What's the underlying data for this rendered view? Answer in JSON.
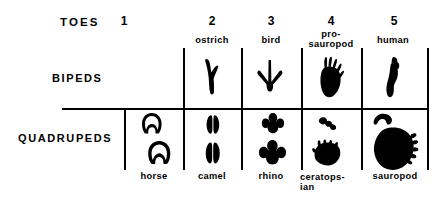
{
  "figure": {
    "title_word": "TOES",
    "row_labels": {
      "bipeds": "BIPEDS",
      "quadrupeds": "QUADRUPEDS"
    },
    "column_numbers": [
      "1",
      "2",
      "3",
      "4",
      "5"
    ],
    "biped_names": {
      "col1": "",
      "col2": "ostrich",
      "col3": "bird",
      "col4_line1": "pro-",
      "col4_line2": "sauropod",
      "col5": "human"
    },
    "quadruped_names": {
      "col1": "horse",
      "col2": "camel",
      "col3": "rhino",
      "col4_line1": "ceratops-",
      "col4_line2": "ian",
      "col5": "sauropod"
    },
    "icons": {
      "ostrich": "ostrich-footprint-icon",
      "bird": "bird-footprint-icon",
      "prosauropod": "prosauropod-footprint-icon",
      "human": "human-footprint-icon",
      "horse_front": "horse-hoof-front-icon",
      "horse_hind": "horse-hoof-hind-icon",
      "camel_front": "camel-footprint-front-icon",
      "camel_hind": "camel-footprint-hind-icon",
      "rhino_front": "rhino-footprint-front-icon",
      "rhino_hind": "rhino-footprint-hind-icon",
      "ceratopsian_front": "ceratopsian-manus-icon",
      "ceratopsian_hind": "ceratopsian-pes-icon",
      "sauropod_front": "sauropod-manus-icon",
      "sauropod_hind": "sauropod-pes-icon"
    },
    "colors": {
      "ink": "#000000",
      "paper": "#ffffff"
    }
  }
}
